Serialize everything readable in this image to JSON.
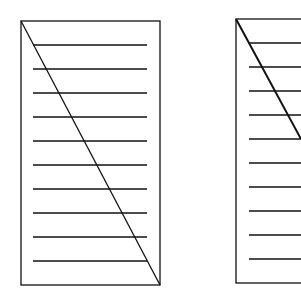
{
  "figure": {
    "width": 301,
    "height": 308,
    "background": "#ffffff",
    "stroke_color": "#111111",
    "panels": [
      {
        "name": "left-panel",
        "frame": {
          "x1": 21,
          "y1": 21,
          "x2": 160,
          "y2": 285
        },
        "diagonal": {
          "x1": 21,
          "y1": 21,
          "x2": 160,
          "y2": 285,
          "width": 1.3
        },
        "lines": {
          "x1": 33,
          "x2": 147,
          "ys": [
            45,
            69,
            93,
            117,
            141,
            165,
            189,
            213,
            237,
            261
          ],
          "count": 10
        }
      },
      {
        "name": "right-panel",
        "frame": {
          "x1": 236,
          "y1": 19,
          "x2": 320,
          "y2": 283
        },
        "diagonal": {
          "x1": 236,
          "y1": 19,
          "x2": 301,
          "y2": 139,
          "width": 2
        },
        "lines": {
          "x1": 249,
          "x2": 301,
          "ys": [
            43,
            67,
            91,
            115,
            139,
            163,
            187,
            211,
            235,
            259
          ],
          "count": 10
        }
      }
    ]
  }
}
